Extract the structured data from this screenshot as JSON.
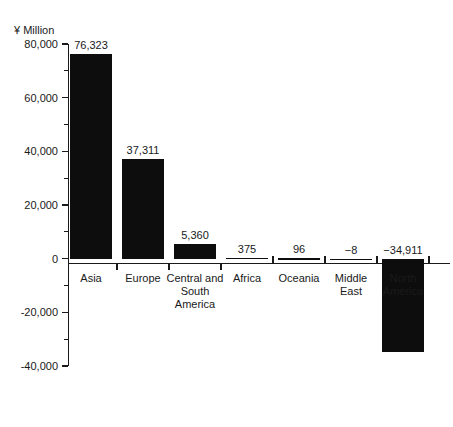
{
  "chart_data": {
    "type": "bar",
    "title": "",
    "subtitle": "",
    "unit_label": "¥ Million",
    "xlabel": "",
    "ylabel": "",
    "orientation": "vertical",
    "grid": false,
    "legend": null,
    "legend_position": "none",
    "ylim": [
      -40000,
      80000
    ],
    "y_major_step": 20000,
    "y_minor_step": 10000,
    "y_tick_labels": [
      "80,000",
      "60,000",
      "40,000",
      "20,000",
      "0",
      "-20,000",
      "-40,000"
    ],
    "y_tick_values": [
      80000,
      60000,
      40000,
      20000,
      0,
      -20000,
      -40000
    ],
    "y_minor_tick_values": [
      70000,
      50000,
      30000,
      10000,
      -10000,
      -30000
    ],
    "categories": [
      "Asia",
      "Europe",
      "Central and\nSouth\nAmerica",
      "Africa",
      "Oceania",
      "Middle\nEast",
      "North\nAmerica"
    ],
    "values": [
      76323,
      37311,
      5360,
      375,
      96,
      -8,
      -34911
    ],
    "data_labels": [
      "76,323",
      "37,311",
      "5,360",
      "375",
      "96",
      "−8",
      "−34,911"
    ],
    "bar_color": "#0d0d0d",
    "axis_color": "#1a1a1a",
    "background_color": "#ffffff"
  }
}
